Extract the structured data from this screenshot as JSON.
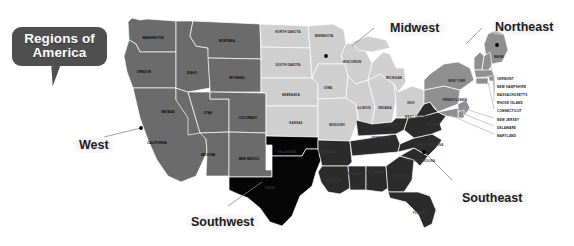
{
  "title": {
    "line1": "Regions of",
    "line2": "America"
  },
  "regions": [
    {
      "name": "West",
      "label": "West",
      "color": "#6b6b6b",
      "x": 74,
      "y": 137
    },
    {
      "name": "Southwest",
      "label": "Southwest",
      "color": "#000000",
      "x": 186,
      "y": 214
    },
    {
      "name": "Midwest",
      "label": "Midwest",
      "color": "#cfcfcf",
      "x": 385,
      "y": 20
    },
    {
      "name": "Northeast",
      "label": "Northeast",
      "color": "#8f8f8f",
      "x": 490,
      "y": 19
    },
    {
      "name": "Southeast",
      "label": "Southeast",
      "color": "#2b2b2b",
      "x": 457,
      "y": 190
    }
  ],
  "map": {
    "background": "#ffffff",
    "border_color": "#ffffff",
    "states": [
      {
        "abbr": "WA",
        "name": "WASHINGTON",
        "region": "West",
        "x": 153,
        "y": 38
      },
      {
        "abbr": "OR",
        "name": "OREGON",
        "region": "West",
        "x": 144,
        "y": 72
      },
      {
        "abbr": "CA",
        "name": "CALIFORNIA",
        "region": "West",
        "x": 157,
        "y": 143
      },
      {
        "abbr": "NV",
        "name": "NEVADA",
        "region": "West",
        "x": 168,
        "y": 112
      },
      {
        "abbr": "ID",
        "name": "IDAHO",
        "region": "West",
        "x": 192,
        "y": 73
      },
      {
        "abbr": "MT",
        "name": "MONTANA",
        "region": "West",
        "x": 227,
        "y": 41
      },
      {
        "abbr": "WY",
        "name": "WYOMING",
        "region": "West",
        "x": 237,
        "y": 78
      },
      {
        "abbr": "UT",
        "name": "UTAH",
        "region": "West",
        "x": 208,
        "y": 113
      },
      {
        "abbr": "CO",
        "name": "COLORADO",
        "region": "West",
        "x": 248,
        "y": 118
      },
      {
        "abbr": "AZ",
        "name": "ARIZONA",
        "region": "West",
        "x": 208,
        "y": 155
      },
      {
        "abbr": "NM",
        "name": "NEW MEXICO",
        "region": "West",
        "x": 249,
        "y": 159
      },
      {
        "abbr": "ND",
        "name": "NORTH DAKOTA",
        "region": "Midwest",
        "x": 288,
        "y": 32
      },
      {
        "abbr": "SD",
        "name": "SOUTH DAKOTA",
        "region": "Midwest",
        "x": 288,
        "y": 65
      },
      {
        "abbr": "NE",
        "name": "NEBRASKA",
        "region": "Midwest",
        "x": 291,
        "y": 95
      },
      {
        "abbr": "KS",
        "name": "KANSAS",
        "region": "Midwest",
        "x": 296,
        "y": 123
      },
      {
        "abbr": "MN",
        "name": "MINNESOTA",
        "region": "Midwest",
        "x": 324,
        "y": 36
      },
      {
        "abbr": "IA",
        "name": "IOWA",
        "region": "Midwest",
        "x": 328,
        "y": 88
      },
      {
        "abbr": "MO",
        "name": "MISSOURI",
        "region": "Midwest",
        "x": 337,
        "y": 125
      },
      {
        "abbr": "WI",
        "name": "WISCONSIN",
        "region": "Midwest",
        "x": 352,
        "y": 62
      },
      {
        "abbr": "IL",
        "name": "ILLINOIS",
        "region": "Midwest",
        "x": 364,
        "y": 108
      },
      {
        "abbr": "IN",
        "name": "INDIANA",
        "region": "Midwest",
        "x": 385,
        "y": 108
      },
      {
        "abbr": "MI",
        "name": "MICHIGAN",
        "region": "Midwest",
        "x": 394,
        "y": 78
      },
      {
        "abbr": "OH",
        "name": "OHIO",
        "region": "Midwest",
        "x": 411,
        "y": 103
      },
      {
        "abbr": "TX",
        "name": "TEXAS",
        "region": "Southwest",
        "x": 270,
        "y": 188
      },
      {
        "abbr": "OK",
        "name": "OKLAHOMA",
        "region": "Southwest",
        "x": 287,
        "y": 152
      },
      {
        "abbr": "AR",
        "name": "ARKANSAS",
        "region": "Southeast",
        "x": 327,
        "y": 152
      },
      {
        "abbr": "LA",
        "name": "LOUISIANA",
        "region": "Southeast",
        "x": 334,
        "y": 180
      },
      {
        "abbr": "MS",
        "name": "MISSISSIPPI",
        "region": "Southeast",
        "x": 356,
        "y": 174
      },
      {
        "abbr": "AL",
        "name": "ALABAMA",
        "region": "Southeast",
        "x": 376,
        "y": 172
      },
      {
        "abbr": "TN",
        "name": "TENNESSEE",
        "region": "Southeast",
        "x": 381,
        "y": 138
      },
      {
        "abbr": "KY",
        "name": "KENTUCKY",
        "region": "Southeast",
        "x": 393,
        "y": 125
      },
      {
        "abbr": "GA",
        "name": "GEORGIA",
        "region": "Southeast",
        "x": 400,
        "y": 176
      },
      {
        "abbr": "FL",
        "name": "FLORIDA",
        "region": "Southeast",
        "x": 420,
        "y": 213
      },
      {
        "abbr": "SC",
        "name": "SOUTH CAROLINA",
        "region": "Southeast",
        "x": 421,
        "y": 161
      },
      {
        "abbr": "NC",
        "name": "NORTH CAROLINA",
        "region": "Southeast",
        "x": 429,
        "y": 145
      },
      {
        "abbr": "VA",
        "name": "VIRGINIA",
        "region": "Southeast",
        "x": 432,
        "y": 125
      },
      {
        "abbr": "WV",
        "name": "WEST VIRGINIA",
        "region": "Southeast",
        "x": 417,
        "y": 117
      },
      {
        "abbr": "NY",
        "name": "NEW YORK",
        "region": "Northeast",
        "x": 457,
        "y": 81
      },
      {
        "abbr": "PA",
        "name": "PENNSYLVANIA",
        "region": "Northeast",
        "x": 455,
        "y": 100
      },
      {
        "abbr": "ME",
        "name": "MAINE",
        "region": "Northeast",
        "x": 499,
        "y": 57
      }
    ],
    "northeast_list": [
      {
        "name": "VERMONT",
        "x": 497,
        "y": 78
      },
      {
        "name": "NEW HAMPSHIRE",
        "x": 497,
        "y": 86
      },
      {
        "name": "MASSACHUSETTS",
        "x": 497,
        "y": 94
      },
      {
        "name": "RHODE ISLAND",
        "x": 497,
        "y": 102
      },
      {
        "name": "CONNECTICUT",
        "x": 497,
        "y": 110
      },
      {
        "name": "NEW JERSEY",
        "x": 497,
        "y": 119
      },
      {
        "name": "DELAWARE",
        "x": 497,
        "y": 127
      },
      {
        "name": "MARYLAND",
        "x": 497,
        "y": 135
      }
    ]
  }
}
